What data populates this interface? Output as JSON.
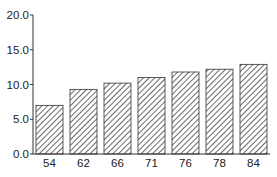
{
  "chart_data": {
    "type": "bar",
    "title": "",
    "xlabel": "",
    "ylabel": "",
    "categories": [
      "54",
      "62",
      "66",
      "71",
      "76",
      "78",
      "84"
    ],
    "values": [
      7.0,
      9.3,
      10.2,
      11.0,
      11.8,
      12.2,
      12.9
    ],
    "ylim": [
      0,
      20
    ],
    "yticks": [
      "0.0",
      "5.0",
      "10.0",
      "15.0",
      "20.0"
    ],
    "grid": false,
    "legend": null,
    "bar_fill": "diagonal-hatch",
    "colors": {
      "bar_stroke": "#333333",
      "hatch": "#444444",
      "axis": "#333333"
    }
  }
}
